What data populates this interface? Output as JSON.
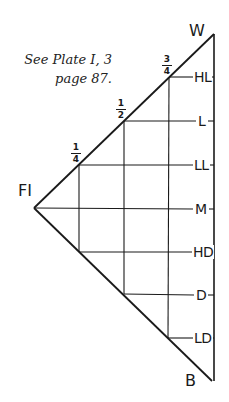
{
  "note": {
    "line1": "See Plate I, 3",
    "line2": "page 87."
  },
  "apexes": {
    "left": "FI",
    "top": "W",
    "bottom": "B"
  },
  "fractions": [
    {
      "num": "1",
      "den": "4"
    },
    {
      "num": "1",
      "den": "2"
    },
    {
      "num": "3",
      "den": "4"
    }
  ],
  "levels": [
    {
      "label": "HL",
      "y": 77
    },
    {
      "label": "L",
      "y": 121
    },
    {
      "label": "LL",
      "y": 165
    },
    {
      "label": "M",
      "y": 209
    },
    {
      "label": "HD",
      "y": 252
    },
    {
      "label": "D",
      "y": 295
    },
    {
      "label": "LD",
      "y": 338
    }
  ],
  "colors": {
    "line": "#1a1a1a",
    "background": "#ffffff"
  }
}
